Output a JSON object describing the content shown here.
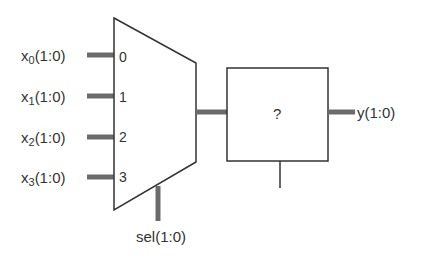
{
  "diagram": {
    "title": "",
    "mux": {
      "inputs": [
        {
          "label_base": "x",
          "label_sub": "0",
          "label_suffix": "(1:0)",
          "port": "0"
        },
        {
          "label_base": "x",
          "label_sub": "1",
          "label_suffix": "(1:0)",
          "port": "1"
        },
        {
          "label_base": "x",
          "label_sub": "2",
          "label_suffix": "(1:0)",
          "port": "2"
        },
        {
          "label_base": "x",
          "label_sub": "3",
          "label_suffix": "(1:0)",
          "port": "3"
        }
      ],
      "select_label": "sel(1:0)"
    },
    "unknown_block": {
      "label": "?"
    },
    "output": {
      "label": "y(1:0)"
    },
    "colors": {
      "line": "#333333",
      "bus": "#6b6b6b",
      "background": "#ffffff"
    }
  }
}
